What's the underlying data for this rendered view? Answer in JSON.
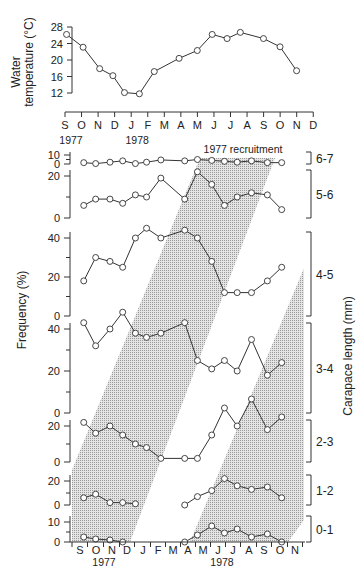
{
  "chart_data": [
    {
      "type": "line",
      "title": "",
      "ylabel": "Water temperature (°C)",
      "ylabel_lines": [
        "Water",
        "temperature  (°C)"
      ],
      "xlabel": "",
      "ylim": [
        12,
        28
      ],
      "yticks": [
        12,
        16,
        20,
        24,
        28
      ],
      "xtick_labels": [
        "S",
        "O",
        "N",
        "D",
        "J",
        "F",
        "M",
        "A",
        "M",
        "J",
        "J",
        "A",
        "S",
        "O",
        "N",
        "D"
      ],
      "year_labels": [
        {
          "label": "1977",
          "at": 0
        },
        {
          "label": "1978",
          "at": 4
        }
      ],
      "x": [
        1.0,
        2.0,
        3.0,
        3.8,
        4.5,
        5.4,
        6.3,
        7.8,
        8.9,
        9.8,
        10.7,
        11.5,
        12.9,
        13.9,
        14.9
      ],
      "values": [
        26.2,
        23.1,
        17.9,
        16.2,
        12.1,
        11.8,
        17.2,
        20.4,
        22.3,
        26.2,
        25.2,
        26.7,
        25.2,
        23.2,
        17.4
      ]
    },
    {
      "type": "line",
      "title": "Size-frequency by carapace length class",
      "ylabel": "Frequency (%)",
      "right_label": "Carapace length (mm)",
      "annotation": "1977 recruitment",
      "xtick_labels": [
        "S",
        "O",
        "N",
        "D",
        "J",
        "F",
        "M",
        "A",
        "M",
        "J",
        "J",
        "A",
        "S",
        "O",
        "N"
      ],
      "year_labels": [
        {
          "label": "1977",
          "at": 1.5
        },
        {
          "label": "1978",
          "at": 9.5
        }
      ],
      "sample_x": [
        0.55,
        1.3,
        2.2,
        3.0,
        3.8,
        4.5,
        5.4,
        6.9,
        7.7,
        8.6,
        9.4,
        10.2,
        11.1,
        12.1,
        13.0
      ],
      "panels": [
        {
          "class": "6-7",
          "yticks": [
            0,
            10
          ],
          "ymax": 10,
          "values": [
            1.5,
            0.5,
            2.0,
            3.5,
            0.5,
            2.0,
            4.5,
            3.5,
            5.0,
            4.0,
            3.0,
            2.0,
            3.5,
            1.5,
            1.5
          ]
        },
        {
          "class": "5-6",
          "yticks": [
            0,
            20
          ],
          "ymax": 25,
          "values": [
            6,
            9,
            9,
            7,
            11,
            10,
            19,
            9,
            22,
            16,
            6,
            10,
            12,
            11,
            4
          ]
        },
        {
          "class": "4-5",
          "yticks": [
            0,
            20,
            40
          ],
          "ymax": 47,
          "values": [
            18,
            30,
            28,
            25,
            40,
            45,
            40,
            44,
            40,
            28,
            12,
            12,
            12,
            18,
            25
          ]
        },
        {
          "class": "3-4",
          "yticks": [
            0,
            20,
            40
          ],
          "ymax": 52,
          "values": [
            43,
            32,
            40,
            48,
            38,
            36,
            38,
            43,
            25,
            21,
            25,
            20,
            35,
            18,
            24
          ]
        },
        {
          "class": "2-3",
          "yticks": [
            0,
            20
          ],
          "ymax": 38,
          "values": [
            22,
            16,
            20,
            15,
            10,
            8,
            2,
            2,
            2,
            15,
            30,
            20,
            35,
            18,
            25
          ]
        },
        {
          "class": "1-2",
          "yticks": [
            0,
            20
          ],
          "ymax": 24,
          "values": [
            6,
            9,
            2,
            2,
            1,
            null,
            null,
            0,
            7,
            12,
            22,
            16,
            13,
            15,
            6
          ]
        },
        {
          "class": "0-1",
          "yticks": [
            0,
            10
          ],
          "ymax": 12,
          "values": [
            2.5,
            1.5,
            1.0,
            0,
            null,
            null,
            null,
            0,
            3.5,
            8.0,
            4.5,
            6.5,
            2.5,
            4.0,
            0
          ]
        }
      ]
    }
  ]
}
